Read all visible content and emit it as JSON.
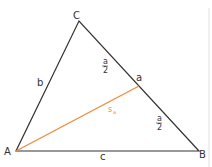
{
  "diagram": {
    "type": "triangle-median",
    "vertices": {
      "A": {
        "label": "A",
        "x": 16,
        "y": 151
      },
      "B": {
        "label": "B",
        "x": 199,
        "y": 151
      },
      "C": {
        "label": "C",
        "x": 79,
        "y": 21
      }
    },
    "sides": {
      "a": {
        "label": "a"
      },
      "b": {
        "label": "b"
      },
      "c": {
        "label": "c"
      }
    },
    "half_label": {
      "num": "a",
      "den": "2"
    },
    "median": {
      "label": "s",
      "subscript": "a",
      "color": "#f08a3c"
    },
    "colors": {
      "edge": "#333333",
      "median": "#f08a3c",
      "border": "#dddddd"
    }
  }
}
